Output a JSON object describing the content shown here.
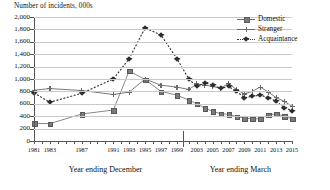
{
  "chart_data": {
    "type": "line",
    "title": "Number of incidents, 000s",
    "ylabel": "Number of incidents, 000s",
    "xlabel": "",
    "ylim": [
      0,
      2000
    ],
    "ytick_step": 200,
    "ytick_labels": [
      "0",
      "200",
      "400",
      "600",
      "800",
      "1,000",
      "1,200",
      "1,400",
      "1,600",
      "1,800",
      "2,000"
    ],
    "grid": true,
    "legend_position": "top-right",
    "axis_segments": [
      {
        "label": "Year ending December",
        "start_year": 1981,
        "end_year": 1999
      },
      {
        "label": "Year ending March",
        "start_year": 2002,
        "end_year": 2015
      }
    ],
    "x_tick_labels": [
      "1981",
      "1983",
      "1987",
      "1991",
      "1993",
      "1995",
      "1997",
      "1999",
      "2003",
      "2005",
      "2007",
      "2009",
      "2011",
      "2013",
      "2015"
    ],
    "x": [
      1981,
      1982,
      1983,
      1984,
      1985,
      1986,
      1987,
      1988,
      1989,
      1990,
      1991,
      1992,
      1993,
      1994,
      1995,
      1996,
      1997,
      1998,
      1999,
      2002,
      2003,
      2004,
      2005,
      2006,
      2007,
      2008,
      2009,
      2010,
      2011,
      2012,
      2013,
      2014,
      2015
    ],
    "series": [
      {
        "name": "Domestic",
        "marker": "square",
        "line_style": "solid",
        "color": "#7a7a7a",
        "values": [
          285,
          null,
          280,
          null,
          null,
          null,
          435,
          null,
          null,
          null,
          500,
          null,
          1130,
          null,
          990,
          null,
          800,
          null,
          740,
          660,
          600,
          530,
          480,
          440,
          430,
          395,
          370,
          355,
          360,
          420,
          440,
          400,
          355
        ]
      },
      {
        "name": "Stranger",
        "marker": "plus",
        "line_style": "solid",
        "color": "#6b6b6b",
        "values": [
          820,
          null,
          845,
          null,
          null,
          null,
          815,
          null,
          null,
          null,
          750,
          null,
          790,
          null,
          1000,
          null,
          900,
          null,
          870,
          830,
          920,
          900,
          880,
          850,
          930,
          830,
          760,
          800,
          870,
          790,
          700,
          640,
          560
        ]
      },
      {
        "name": "Acquaintance",
        "marker": "diamond",
        "line_style": "dotted",
        "color": "#2e2e2e",
        "values": [
          775,
          null,
          625,
          null,
          null,
          null,
          770,
          null,
          null,
          null,
          1000,
          null,
          1330,
          null,
          1825,
          null,
          1710,
          null,
          1330,
          1000,
          880,
          940,
          900,
          850,
          880,
          800,
          700,
          720,
          740,
          700,
          640,
          540,
          490
        ]
      }
    ]
  },
  "legend": {
    "items": [
      {
        "label": "Domestic"
      },
      {
        "label": "Stranger"
      },
      {
        "label": "Acquaintance"
      }
    ]
  },
  "axes": {
    "left_axis_title": "Year ending December",
    "right_axis_title": "Year ending March"
  }
}
